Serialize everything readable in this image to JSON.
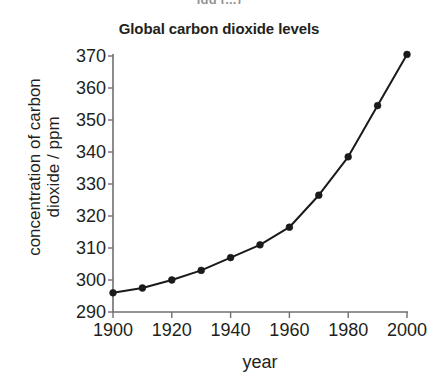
{
  "top_fragment": "igg (...)",
  "chart_data": {
    "type": "line",
    "title": "Global carbon dioxide levels",
    "xlabel": "year",
    "ylabel_line1": "concentration of carbon",
    "ylabel_line2": "dioxide / ppm",
    "ylabel": "concentration of carbon dioxide / ppm",
    "x": [
      1900,
      1910,
      1920,
      1930,
      1940,
      1950,
      1960,
      1970,
      1980,
      1990,
      2000
    ],
    "values": [
      296,
      297.5,
      300,
      303,
      307,
      311,
      316.5,
      326.5,
      338.5,
      354.5,
      370.5
    ],
    "xlim": [
      1900,
      2000
    ],
    "ylim": [
      290,
      370
    ],
    "x_ticks": [
      1900,
      1920,
      1940,
      1960,
      1980,
      2000
    ],
    "x_tick_labels": [
      "1900",
      "1920",
      "1940",
      "1960",
      "1980",
      "2000"
    ],
    "y_ticks": [
      290,
      300,
      310,
      320,
      330,
      340,
      350,
      360,
      370
    ],
    "y_tick_labels": [
      "290",
      "300",
      "310",
      "320",
      "330",
      "340",
      "350",
      "360",
      "370"
    ],
    "grid": false,
    "legend": false,
    "marker": "circle",
    "line_color": "#1a1a1a",
    "marker_color": "#1a1a1a",
    "axis_color": "#6f6f6f",
    "background": "#ffffff",
    "series": [
      {
        "name": "Global carbon dioxide levels",
        "values": [
          296,
          297.5,
          300,
          303,
          307,
          311,
          316.5,
          326.5,
          338.5,
          354.5,
          370.5
        ]
      }
    ]
  }
}
